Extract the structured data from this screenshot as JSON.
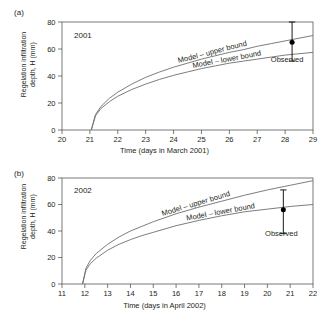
{
  "figure": {
    "background": "#ffffff",
    "line_color": "#6d6e71",
    "axis_color": "#58595b",
    "text_color": "#231f20",
    "marker_color": "#000000"
  },
  "panels": [
    {
      "letter": "(a)",
      "year_annotation": "2001",
      "ylabel_line1": "Regelation infiltration",
      "ylabel_line2": "depth, H (mm)",
      "xlabel": "Time (days in March 2001)",
      "upper_label": "Model – upper bound",
      "lower_label": "Model – lower bound",
      "observed_label": "Observed",
      "yticks": [
        "0",
        "20",
        "40",
        "60",
        "80"
      ],
      "xticks": [
        "20",
        "21",
        "22",
        "23",
        "24",
        "25",
        "26",
        "27",
        "28",
        "29"
      ]
    },
    {
      "letter": "(b)",
      "year_annotation": "2002",
      "ylabel_line1": "Regelation infiltration",
      "ylabel_line2": "depth, H (mm)",
      "xlabel": "Time (days in April 2002)",
      "upper_label": "Model – upper bound",
      "lower_label": "Model – lower bound",
      "observed_label": "Observed",
      "yticks": [
        "0",
        "20",
        "40",
        "60",
        "80"
      ],
      "xticks": [
        "11",
        "12",
        "13",
        "14",
        "15",
        "16",
        "17",
        "18",
        "19",
        "20",
        "21",
        "22"
      ]
    }
  ],
  "chart_data": [
    {
      "type": "line",
      "title": "(a) 2001",
      "xlabel": "Time (days in March 2001)",
      "ylabel": "Regelation infiltration depth, H (mm)",
      "xlim": [
        20,
        29
      ],
      "ylim": [
        0,
        80
      ],
      "xticks": [
        20,
        21,
        22,
        23,
        24,
        25,
        26,
        27,
        28,
        29
      ],
      "yticks": [
        0,
        20,
        40,
        60,
        80
      ],
      "grid": false,
      "legend": "inline-annotations",
      "annotations": [
        "2001",
        "Model – upper bound",
        "Model – lower bound",
        "Observed"
      ],
      "series": [
        {
          "name": "Model – upper bound",
          "x": [
            21.05,
            21.2,
            21.4,
            21.7,
            22.0,
            22.5,
            23.0,
            23.5,
            24.0,
            24.5,
            25.0,
            25.5,
            26.0,
            26.5,
            27.0,
            27.5,
            28.0,
            28.5,
            29.0
          ],
          "values": [
            0,
            11.5,
            17.5,
            23.5,
            28.0,
            34.0,
            39.0,
            43.0,
            46.5,
            49.5,
            52.5,
            55.0,
            57.5,
            59.5,
            62.0,
            64.0,
            66.0,
            68.0,
            70.0
          ]
        },
        {
          "name": "Model – lower bound",
          "x": [
            21.05,
            21.2,
            21.4,
            21.7,
            22.0,
            22.5,
            23.0,
            23.5,
            24.0,
            24.5,
            25.0,
            25.5,
            26.0,
            26.5,
            27.0,
            27.5,
            28.0,
            28.5,
            29.0
          ],
          "values": [
            0,
            10.5,
            16.0,
            21.0,
            25.0,
            30.0,
            34.0,
            37.5,
            40.5,
            43.0,
            45.5,
            47.5,
            49.5,
            51.0,
            52.5,
            54.0,
            55.5,
            56.5,
            57.5
          ]
        }
      ],
      "observed": {
        "x": 28.25,
        "y": 65,
        "err_low": 51,
        "err_high": 80,
        "label": "Observed"
      }
    },
    {
      "type": "line",
      "title": "(b) 2002",
      "xlabel": "Time (days in April 2002)",
      "ylabel": "Regelation infiltration depth, H (mm)",
      "xlim": [
        11,
        22
      ],
      "ylim": [
        0,
        80
      ],
      "xticks": [
        11,
        12,
        13,
        14,
        15,
        16,
        17,
        18,
        19,
        20,
        21,
        22
      ],
      "yticks": [
        0,
        20,
        40,
        60,
        80
      ],
      "grid": false,
      "legend": "inline-annotations",
      "annotations": [
        "2002",
        "Model – upper bound",
        "Model – lower bound",
        "Observed"
      ],
      "series": [
        {
          "name": "Model – upper bound",
          "x": [
            11.9,
            12.05,
            12.25,
            12.5,
            13.0,
            13.5,
            14.0,
            14.5,
            15.0,
            16.0,
            17.0,
            18.0,
            19.0,
            20.0,
            21.0,
            22.0
          ],
          "values": [
            0,
            12.0,
            18.0,
            23.0,
            30.0,
            35.5,
            40.0,
            43.5,
            47.0,
            53.0,
            58.0,
            62.5,
            67.0,
            71.0,
            74.5,
            78.0
          ]
        },
        {
          "name": "Model – lower bound",
          "x": [
            11.9,
            12.05,
            12.25,
            12.5,
            13.0,
            13.5,
            14.0,
            14.5,
            15.0,
            16.0,
            17.0,
            18.0,
            19.0,
            20.0,
            21.0,
            22.0
          ],
          "values": [
            0,
            10.5,
            15.5,
            19.5,
            25.5,
            30.0,
            33.5,
            36.5,
            39.0,
            44.0,
            48.0,
            51.5,
            54.5,
            56.5,
            58.5,
            60.0
          ]
        }
      ],
      "observed": {
        "x": 20.7,
        "y": 56,
        "err_low": 38,
        "err_high": 71,
        "label": "Observed"
      }
    }
  ]
}
